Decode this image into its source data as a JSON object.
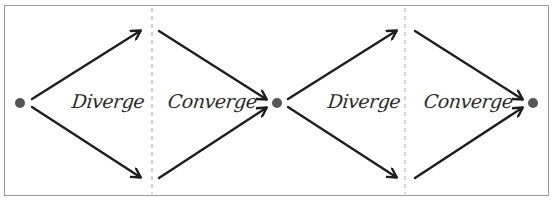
{
  "diagram": {
    "title": "",
    "colors": {
      "stroke": "#1e1e1e",
      "dot": "#555555",
      "divider": "#b5b5b5",
      "border": "#9a9a9a",
      "text": "#2a2a2a"
    },
    "nodes": [
      {
        "id": "start",
        "x": 20,
        "y": 103
      },
      {
        "id": "middle",
        "x": 277,
        "y": 103
      },
      {
        "id": "end",
        "x": 533,
        "y": 103
      }
    ],
    "dividers": [
      152,
      405
    ],
    "phases": [
      {
        "label": "Diverge",
        "type": "diverge"
      },
      {
        "label": "Converge",
        "type": "converge"
      },
      {
        "label": "Diverge",
        "type": "diverge"
      },
      {
        "label": "Converge",
        "type": "converge"
      }
    ]
  }
}
